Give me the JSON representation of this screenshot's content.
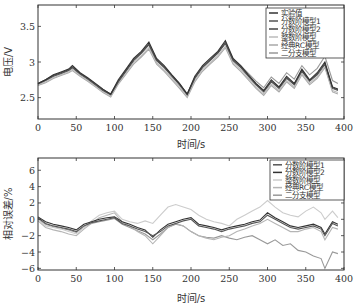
{
  "chart_data": [
    {
      "type": "line",
      "title": "",
      "xlabel": "时间/s",
      "ylabel": "电压/V",
      "xlim": [
        0,
        400
      ],
      "ylim": [
        2.2,
        3.8
      ],
      "xticks": [
        0,
        50,
        100,
        150,
        200,
        250,
        300,
        350,
        400
      ],
      "yticks": [
        2.5,
        3,
        3.5
      ],
      "ytick_labels": [
        "2.5",
        "3",
        "3.5"
      ],
      "grid": false,
      "legend_position": "upper right",
      "x": [
        0,
        10,
        20,
        30,
        40,
        45,
        55,
        65,
        75,
        85,
        95,
        105,
        115,
        125,
        135,
        145,
        155,
        165,
        175,
        185,
        195,
        205,
        215,
        225,
        235,
        245,
        255,
        265,
        275,
        285,
        295,
        305,
        315,
        325,
        335,
        345,
        355,
        365,
        375,
        385,
        392
      ],
      "series": [
        {
          "name": "实验值",
          "color": "#333333",
          "values": [
            2.7,
            2.75,
            2.82,
            2.86,
            2.9,
            2.95,
            2.85,
            2.78,
            2.7,
            2.62,
            2.55,
            2.75,
            2.9,
            3.05,
            3.15,
            3.28,
            3.05,
            2.95,
            2.82,
            2.7,
            2.55,
            2.8,
            2.95,
            3.05,
            3.15,
            3.3,
            3.05,
            2.95,
            2.82,
            2.7,
            2.6,
            2.75,
            2.65,
            2.8,
            2.7,
            2.9,
            2.75,
            2.85,
            3.0,
            2.65,
            2.62
          ]
        },
        {
          "name": "分数阶模型1",
          "color": "#555555",
          "values": [
            2.69,
            2.74,
            2.8,
            2.84,
            2.88,
            2.92,
            2.83,
            2.76,
            2.68,
            2.6,
            2.54,
            2.72,
            2.87,
            3.02,
            3.12,
            3.24,
            3.02,
            2.92,
            2.8,
            2.68,
            2.54,
            2.77,
            2.92,
            3.02,
            3.12,
            3.26,
            3.02,
            2.92,
            2.8,
            2.68,
            2.58,
            2.72,
            2.63,
            2.77,
            2.68,
            2.87,
            2.73,
            2.82,
            2.97,
            2.63,
            2.6
          ]
        },
        {
          "name": "分数阶模型2",
          "color": "#444444",
          "values": [
            2.7,
            2.75,
            2.81,
            2.85,
            2.89,
            2.93,
            2.84,
            2.77,
            2.69,
            2.61,
            2.55,
            2.73,
            2.88,
            3.03,
            3.13,
            3.25,
            3.03,
            2.93,
            2.81,
            2.69,
            2.55,
            2.78,
            2.93,
            3.03,
            3.13,
            3.27,
            3.03,
            2.93,
            2.81,
            2.69,
            2.59,
            2.73,
            2.64,
            2.78,
            2.69,
            2.88,
            2.74,
            2.83,
            2.98,
            2.64,
            2.61
          ]
        },
        {
          "name": "整数阶模型",
          "color": "#bbbbbb",
          "values": [
            2.68,
            2.72,
            2.78,
            2.82,
            2.86,
            2.9,
            2.81,
            2.74,
            2.66,
            2.58,
            2.52,
            2.7,
            2.84,
            2.99,
            3.09,
            3.2,
            2.99,
            2.89,
            2.77,
            2.65,
            2.52,
            2.74,
            2.89,
            2.99,
            3.09,
            3.22,
            2.99,
            2.89,
            2.77,
            2.65,
            2.55,
            2.69,
            2.6,
            2.74,
            2.65,
            2.84,
            2.7,
            2.79,
            2.94,
            2.6,
            2.57
          ]
        },
        {
          "name": "经典RC模型",
          "color": "#a8a8a8",
          "values": [
            2.67,
            2.71,
            2.77,
            2.81,
            2.85,
            2.88,
            2.8,
            2.73,
            2.65,
            2.57,
            2.51,
            2.69,
            2.83,
            2.97,
            3.07,
            3.18,
            2.97,
            2.87,
            2.75,
            2.63,
            2.5,
            2.72,
            2.87,
            2.97,
            3.07,
            3.2,
            2.97,
            2.87,
            2.75,
            2.63,
            2.53,
            2.67,
            2.58,
            2.72,
            2.63,
            2.82,
            2.68,
            2.77,
            2.92,
            2.58,
            2.55
          ]
        },
        {
          "name": "二分支模型",
          "color": "#999999",
          "values": [
            2.7,
            2.74,
            2.8,
            2.84,
            2.88,
            2.92,
            2.83,
            2.76,
            2.68,
            2.6,
            2.54,
            2.73,
            2.88,
            3.03,
            3.13,
            3.25,
            3.03,
            2.93,
            2.81,
            2.69,
            2.55,
            2.78,
            2.93,
            3.03,
            3.13,
            3.27,
            3.04,
            2.95,
            2.84,
            2.73,
            2.64,
            2.79,
            2.7,
            2.85,
            2.76,
            2.95,
            2.82,
            2.91,
            3.08,
            2.74,
            2.7
          ]
        }
      ]
    },
    {
      "type": "line",
      "title": "",
      "xlabel": "时间/s",
      "ylabel": "相对误差/%",
      "xlim": [
        0,
        400
      ],
      "ylim": [
        -6.2,
        7.5
      ],
      "xticks": [
        0,
        50,
        100,
        150,
        200,
        250,
        300,
        350,
        400
      ],
      "yticks": [
        -6,
        -4,
        -2,
        0,
        2,
        4,
        6
      ],
      "ytick_labels": [
        "−6",
        "−4",
        "−2",
        "0",
        "2",
        "4",
        "6"
      ],
      "grid": false,
      "legend_position": "upper right",
      "x": [
        0,
        10,
        20,
        30,
        40,
        50,
        60,
        70,
        80,
        90,
        100,
        110,
        120,
        130,
        140,
        150,
        160,
        170,
        180,
        190,
        200,
        210,
        220,
        230,
        240,
        250,
        260,
        270,
        280,
        290,
        300,
        310,
        320,
        330,
        340,
        350,
        360,
        370,
        375,
        385,
        392
      ],
      "series": [
        {
          "name": "分数阶模型1",
          "color": "#555555",
          "values": [
            0.2,
            -0.5,
            -0.8,
            -1.0,
            -1.2,
            -1.5,
            -0.8,
            -0.4,
            -0.2,
            0.0,
            0.2,
            -0.5,
            -0.8,
            -1.2,
            -1.5,
            -2.0,
            -1.5,
            -0.8,
            -0.5,
            -0.2,
            0.0,
            -0.8,
            -1.0,
            -1.2,
            -1.5,
            -1.2,
            -1.0,
            -0.8,
            -0.5,
            -0.3,
            0.5,
            0.0,
            -0.5,
            -1.0,
            -1.2,
            -1.0,
            -0.8,
            -1.2,
            -2.0,
            -0.5,
            -0.8
          ]
        },
        {
          "name": "分数阶模型2",
          "color": "#333333",
          "values": [
            0.3,
            -0.3,
            -0.6,
            -0.8,
            -1.0,
            -1.3,
            -0.6,
            -0.3,
            0.0,
            0.2,
            0.3,
            -0.3,
            -0.6,
            -1.0,
            -1.3,
            -2.2,
            -1.3,
            -0.6,
            -0.3,
            0.0,
            0.2,
            -0.6,
            -0.8,
            -1.0,
            -1.3,
            -1.0,
            -0.8,
            -0.6,
            -0.3,
            -0.1,
            0.8,
            0.2,
            -0.3,
            -0.8,
            -1.0,
            -0.8,
            -0.6,
            -1.0,
            -1.8,
            -0.3,
            -0.6
          ]
        },
        {
          "name": "整数阶模型",
          "color": "#cccccc",
          "values": [
            0.0,
            -0.8,
            -1.0,
            -1.2,
            -1.5,
            -1.8,
            -1.0,
            -0.2,
            0.5,
            0.8,
            1.0,
            0.0,
            -0.3,
            -0.5,
            -0.2,
            -0.5,
            0.5,
            1.5,
            1.8,
            1.5,
            1.2,
            0.5,
            0.0,
            -0.3,
            -0.5,
            -0.8,
            0.0,
            0.5,
            1.0,
            1.5,
            2.3,
            1.5,
            0.8,
            0.5,
            0.3,
            1.0,
            1.5,
            0.8,
            0.0,
            1.0,
            0.2
          ]
        },
        {
          "name": "经典RC模型",
          "color": "#b5b5b5",
          "values": [
            -0.2,
            -1.0,
            -1.3,
            -1.5,
            -1.8,
            -2.0,
            -1.2,
            -0.5,
            0.2,
            0.5,
            0.8,
            -0.3,
            -0.8,
            -1.5,
            -2.0,
            -3.0,
            -2.0,
            -1.0,
            -0.5,
            -0.8,
            -1.5,
            -2.0,
            -2.3,
            -2.5,
            -2.2,
            -2.0,
            -1.5,
            -1.2,
            -0.8,
            -0.5,
            0.0,
            -0.5,
            -1.0,
            -1.5,
            -1.5,
            -1.2,
            -1.0,
            -1.5,
            -2.5,
            -1.0,
            -1.2
          ]
        },
        {
          "name": "二分支模型",
          "color": "#999999",
          "values": [
            0.0,
            -0.6,
            -0.9,
            -1.1,
            -1.3,
            -1.6,
            -0.9,
            -0.5,
            -0.3,
            -0.1,
            0.1,
            -0.6,
            -1.0,
            -1.4,
            -1.8,
            -2.5,
            -1.8,
            -1.0,
            -0.6,
            -0.8,
            -1.5,
            -2.0,
            -2.2,
            -2.3,
            -2.0,
            -2.3,
            -2.5,
            -2.2,
            -2.0,
            -2.5,
            -3.0,
            -2.5,
            -3.2,
            -3.0,
            -3.8,
            -4.0,
            -4.5,
            -4.8,
            -6.0,
            -4.0,
            -4.2
          ]
        }
      ]
    }
  ],
  "top_chart": {
    "ylabel": "电压/V",
    "xlabel": "时间/s",
    "yticks": [
      {
        "v": 2.5,
        "label": "2.5"
      },
      {
        "v": 3,
        "label": "3"
      },
      {
        "v": 3.5,
        "label": "3.5"
      }
    ],
    "xticks": [
      "0",
      "50",
      "100",
      "150",
      "200",
      "250",
      "300",
      "350",
      "400"
    ],
    "legend": [
      "实验值",
      "分数阶模型1",
      "分数阶模型2",
      "整数阶模型",
      "经典RC模型",
      "二分支模型"
    ]
  },
  "bottom_chart": {
    "ylabel": "相对误差/%",
    "xlabel": "时间/s",
    "yticks": [
      {
        "v": 6,
        "label": "6"
      },
      {
        "v": 4,
        "label": "4"
      },
      {
        "v": 2,
        "label": "2"
      },
      {
        "v": 0,
        "label": "0"
      },
      {
        "v": -2,
        "label": "−2"
      },
      {
        "v": -4,
        "label": "−4"
      },
      {
        "v": -6,
        "label": "−6"
      }
    ],
    "xticks": [
      "0",
      "50",
      "100",
      "150",
      "200",
      "250",
      "300",
      "350",
      "400"
    ],
    "legend": [
      "分数阶模型1",
      "分数阶模型2",
      "整数阶模型",
      "经典RC模型",
      "二分支模型"
    ]
  }
}
